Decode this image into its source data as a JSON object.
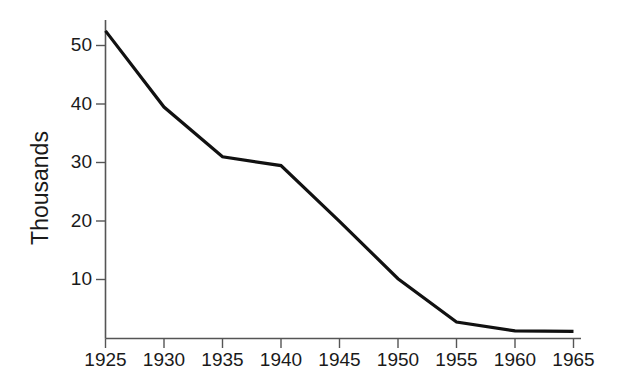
{
  "chart_data": {
    "type": "line",
    "title": "",
    "xlabel": "",
    "ylabel": "Thousands",
    "x": [
      1925,
      1930,
      1935,
      1940,
      1945,
      1950,
      1955,
      1960,
      1965
    ],
    "categories": [
      "1925",
      "1930",
      "1935",
      "1940",
      "1945",
      "1950",
      "1955",
      "1960",
      "1965"
    ],
    "values": [
      52.5,
      39.5,
      31.0,
      29.5,
      20.0,
      10.2,
      2.8,
      1.3,
      1.2
    ],
    "series": [
      {
        "name": "Thousands",
        "values": [
          52.5,
          39.5,
          31.0,
          29.5,
          20.0,
          10.2,
          2.8,
          1.3,
          1.2
        ],
        "color": "#111111"
      }
    ],
    "xlim": [
      1925,
      1965
    ],
    "ylim": [
      0,
      55
    ],
    "xticks": [
      1925,
      1930,
      1935,
      1940,
      1945,
      1950,
      1955,
      1960,
      1965
    ],
    "xtick_labels": [
      "1925",
      "1930",
      "1935",
      "1940",
      "1945",
      "1950",
      "1955",
      "1960",
      "1965"
    ],
    "yticks": [
      10,
      20,
      30,
      40,
      50
    ],
    "ytick_labels": [
      "10",
      "20",
      "30",
      "40",
      "50"
    ],
    "grid": false,
    "legend": false,
    "legend_position": "none",
    "background_color": "#ffffff",
    "axis_color": "#555555",
    "line_color": "#111111"
  },
  "labels": {
    "y_axis_title": "Thousands",
    "y_tick_50": "50",
    "y_tick_40": "40",
    "y_tick_30": "30",
    "y_tick_20": "20",
    "y_tick_10": "10",
    "x_tick_1925": "1925",
    "x_tick_1930": "1930",
    "x_tick_1935": "1935",
    "x_tick_1940": "1940",
    "x_tick_1945": "1945",
    "x_tick_1950": "1950",
    "x_tick_1955": "1955",
    "x_tick_1960": "1960",
    "x_tick_1965": "1965"
  }
}
